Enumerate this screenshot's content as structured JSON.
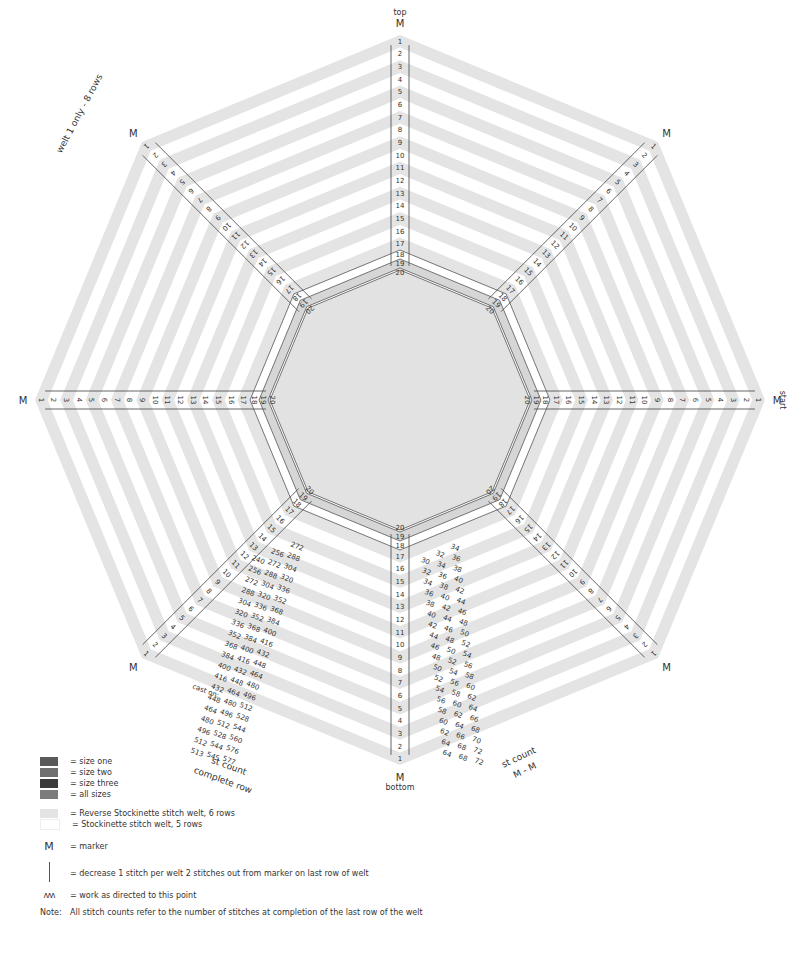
{
  "diagram": {
    "center": [
      400,
      400
    ],
    "outer_radius": 365,
    "welts": 20,
    "stripe_colors": [
      "#e4e4e4",
      "#ffffff"
    ],
    "inner_band_color": "#d6d6d6",
    "center_color": "#e2e2e2",
    "line_color": "#555555",
    "row_numbers": [
      "1",
      "2",
      "3",
      "4",
      "5",
      "6",
      "7",
      "8",
      "9",
      "10",
      "11",
      "12",
      "13",
      "14",
      "15",
      "16",
      "17",
      "18",
      "19",
      "20"
    ],
    "marker_label": "M",
    "direction_labels": {
      "top": "top",
      "bottom": "bottom",
      "start": "start"
    },
    "side_note": "welt 1 only - 8 rows",
    "st_count_complete_row": {
      "title_line1": "st count",
      "title_line2": "complete row",
      "cast_on_label": "cast on:",
      "rows": [
        [
          "",
          "",
          "272"
        ],
        [
          "",
          "256",
          "288"
        ],
        [
          "240",
          "272",
          "304"
        ],
        [
          "256",
          "288",
          "320"
        ],
        [
          "272",
          "304",
          "336"
        ],
        [
          "288",
          "320",
          "352"
        ],
        [
          "304",
          "336",
          "368"
        ],
        [
          "320",
          "352",
          "384"
        ],
        [
          "336",
          "368",
          "400"
        ],
        [
          "352",
          "384",
          "416"
        ],
        [
          "368",
          "400",
          "432"
        ],
        [
          "384",
          "416",
          "448"
        ],
        [
          "400",
          "432",
          "464"
        ],
        [
          "416",
          "448",
          "480"
        ],
        [
          "432",
          "464",
          "496"
        ],
        [
          "448",
          "480",
          "512"
        ],
        [
          "464",
          "496",
          "528"
        ],
        [
          "480",
          "512",
          "544"
        ],
        [
          "496",
          "528",
          "560"
        ],
        [
          "512",
          "544",
          "576"
        ],
        [
          "513",
          "545",
          "577"
        ]
      ]
    },
    "st_count_m_m": {
      "title_line1": "st count",
      "title_line2": "M - M",
      "rows": [
        [
          "",
          "",
          "34"
        ],
        [
          "",
          "32",
          "36"
        ],
        [
          "30",
          "34",
          "38"
        ],
        [
          "32",
          "36",
          "40"
        ],
        [
          "34",
          "38",
          "42"
        ],
        [
          "36",
          "40",
          "44"
        ],
        [
          "38",
          "42",
          "46"
        ],
        [
          "40",
          "44",
          "48"
        ],
        [
          "42",
          "46",
          "50"
        ],
        [
          "44",
          "48",
          "52"
        ],
        [
          "46",
          "50",
          "54"
        ],
        [
          "48",
          "52",
          "56"
        ],
        [
          "50",
          "54",
          "58"
        ],
        [
          "52",
          "56",
          "60"
        ],
        [
          "54",
          "58",
          "62"
        ],
        [
          "56",
          "60",
          "64"
        ],
        [
          "58",
          "62",
          "66"
        ],
        [
          "60",
          "64",
          "68"
        ],
        [
          "62",
          "66",
          "70"
        ],
        [
          "64",
          "68",
          "72"
        ],
        [
          "64",
          "68",
          "72"
        ]
      ]
    }
  },
  "legend": {
    "sizes": [
      {
        "color": "#5a5a5a",
        "label": "= size one"
      },
      {
        "color": "#707070",
        "label": "= size two"
      },
      {
        "color": "#3c3c3c",
        "label": "= size three"
      },
      {
        "color": "#7c7c7c",
        "label": "= all sizes"
      }
    ],
    "welts": [
      {
        "color": "#e4e4e4",
        "label": "= Reverse Stockinette stitch welt, 6 rows"
      },
      {
        "color": "#ffffff",
        "label": "= Stockinette stitch welt, 5 rows"
      }
    ],
    "marker": {
      "symbol": "M",
      "label": "= marker"
    },
    "decrease": {
      "symbol": "|",
      "label": "= decrease 1 stitch per welt 2 stitches out from marker on last row of welt"
    },
    "work_to": {
      "symbol": "ʌʌʌ",
      "label": "= work as directed to this point"
    },
    "note": {
      "label": "Note:",
      "text": "All stitch counts refer to the number of stitches at completion of the last row of the welt"
    }
  }
}
